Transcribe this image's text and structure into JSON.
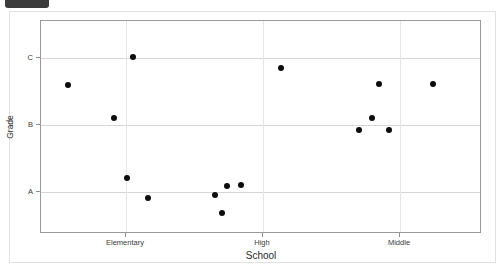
{
  "window": {
    "top_chip_color": "#3b3b3b"
  },
  "chart_data": {
    "type": "scatter",
    "title": "",
    "xlabel": "School",
    "ylabel": "Grade",
    "grid": true,
    "legend": false,
    "marker_color": "#0d0d0d",
    "categories": [
      "Elementary",
      "High",
      "Middle"
    ],
    "ytick_labels": [
      "A",
      "B",
      "C"
    ],
    "ylim": [
      "A-minus",
      "C-plus"
    ],
    "points": [
      {
        "school": "Elementary",
        "grade": "B+",
        "px": 67,
        "py": 84
      },
      {
        "school": "Elementary",
        "grade": "C",
        "px": 132,
        "py": 56
      },
      {
        "school": "Elementary",
        "grade": "B",
        "px": 113,
        "py": 117
      },
      {
        "school": "Elementary",
        "grade": "A+",
        "px": 126,
        "py": 177
      },
      {
        "school": "Elementary",
        "grade": "A",
        "px": 147,
        "py": 197
      },
      {
        "school": "High",
        "grade": "A",
        "px": 214,
        "py": 194
      },
      {
        "school": "High",
        "grade": "A-",
        "px": 221,
        "py": 212
      },
      {
        "school": "High",
        "grade": "A+",
        "px": 226,
        "py": 185
      },
      {
        "school": "High",
        "grade": "A+",
        "px": 240,
        "py": 184
      },
      {
        "school": "High",
        "grade": "C",
        "px": 280,
        "py": 67
      },
      {
        "school": "Middle",
        "grade": "B",
        "px": 358,
        "py": 129
      },
      {
        "school": "Middle",
        "grade": "B+",
        "px": 371,
        "py": 117
      },
      {
        "school": "Middle",
        "grade": "B",
        "px": 388,
        "py": 129
      },
      {
        "school": "Middle",
        "grade": "B++",
        "px": 378,
        "py": 83
      },
      {
        "school": "Middle",
        "grade": "B++",
        "px": 432,
        "py": 83
      }
    ]
  },
  "axes": {
    "y_ticks": [
      {
        "label": "C",
        "py": 57
      },
      {
        "label": "B",
        "py": 124
      },
      {
        "label": "A",
        "py": 191
      }
    ],
    "x_ticks": [
      {
        "label": "Elementary",
        "px": 125
      },
      {
        "label": "High",
        "px": 262
      },
      {
        "label": "Middle",
        "px": 399
      }
    ]
  }
}
